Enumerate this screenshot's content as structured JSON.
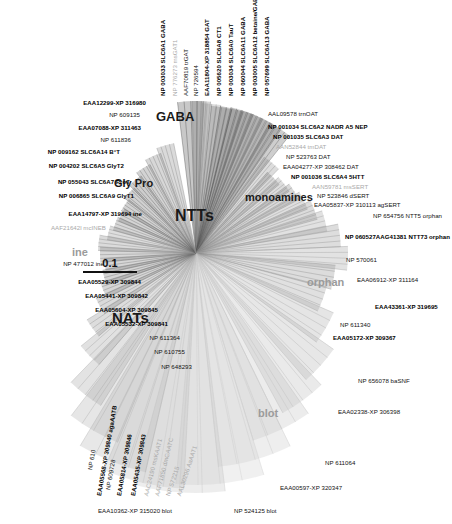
{
  "figure": {
    "type": "radial-phylogenetic-tree",
    "center": {
      "x": 196,
      "y": 253
    },
    "scale_bar": {
      "value": "0.1",
      "units": "substitutions per site",
      "length_px": 54
    }
  },
  "group_labels": [
    {
      "id": "ntts",
      "text": "NTTs",
      "x": 175,
      "y": 208,
      "size": 16,
      "style": "dark"
    },
    {
      "id": "gaba",
      "text": "GABA",
      "x": 156,
      "y": 110,
      "size": 13,
      "style": "dark"
    },
    {
      "id": "glypro",
      "text": "Gly Pro",
      "x": 114,
      "y": 178,
      "size": 11,
      "style": "dark"
    },
    {
      "id": "monoamines",
      "text": "monoamines",
      "x": 245,
      "y": 192,
      "size": 11,
      "style": "dark"
    },
    {
      "id": "ine",
      "text": "ine",
      "x": 72,
      "y": 247,
      "size": 11,
      "style": "light"
    },
    {
      "id": "nats",
      "text": "NATs",
      "x": 112,
      "y": 310,
      "size": 15,
      "style": "dark"
    },
    {
      "id": "orphan",
      "text": "orphan",
      "x": 307,
      "y": 277,
      "size": 11,
      "style": "light"
    },
    {
      "id": "blot",
      "text": "blot",
      "x": 258,
      "y": 408,
      "size": 11,
      "style": "light"
    }
  ],
  "leaves": [
    {
      "id": "l01",
      "text": "NP 003033 SLC6A1 GABA",
      "x": 163,
      "y": 96,
      "rot": -90,
      "weight": "bold",
      "anchor": "start"
    },
    {
      "id": "l02",
      "text": "NP 776273 msGAT1",
      "x": 175,
      "y": 96,
      "rot": -90,
      "weight": "gray",
      "anchor": "start"
    },
    {
      "id": "l03",
      "text": "AAF70819 trGAT",
      "x": 186,
      "y": 96,
      "rot": -90,
      "weight": "normal",
      "anchor": "start"
    },
    {
      "id": "l04",
      "text": "NP 726594",
      "x": 196,
      "y": 96,
      "rot": -90,
      "weight": "normal",
      "anchor": "start"
    },
    {
      "id": "l05",
      "text": "EAA11804-XP 318854 GAT",
      "x": 207,
      "y": 96,
      "rot": -90,
      "weight": "bold",
      "anchor": "start"
    },
    {
      "id": "l06",
      "text": "NP 005620 SLC6A8 CT1",
      "x": 219,
      "y": 96,
      "rot": -90,
      "weight": "bold",
      "anchor": "start"
    },
    {
      "id": "l07",
      "text": "NP 003034 SLC6A0 TauT",
      "x": 231,
      "y": 96,
      "rot": -90,
      "weight": "bold",
      "anchor": "start"
    },
    {
      "id": "l08",
      "text": "NP 060044 SLC6A11 GABA",
      "x": 243,
      "y": 96,
      "rot": -90,
      "weight": "bold",
      "anchor": "start"
    },
    {
      "id": "l09",
      "text": "NP 003005 SLC6A12 betaine/GABA",
      "x": 255,
      "y": 96,
      "rot": -90,
      "weight": "bold",
      "anchor": "start"
    },
    {
      "id": "l10",
      "text": "NP 057699 SLC6A13 GABA",
      "x": 267,
      "y": 96,
      "rot": -90,
      "weight": "bold",
      "anchor": "start"
    },
    {
      "id": "l11",
      "text": "AAL09578 trnOAT",
      "x": 268,
      "y": 114,
      "rot": 0,
      "weight": "normal",
      "anchor": "start"
    },
    {
      "id": "l12",
      "text": "NP 001034 SLC6A2 NADR A5 NEP",
      "x": 268,
      "y": 127,
      "rot": 0,
      "weight": "bold",
      "anchor": "start"
    },
    {
      "id": "l13",
      "text": "NP 001035 SLC6A3 DAT",
      "x": 273,
      "y": 137,
      "rot": 0,
      "weight": "bold",
      "anchor": "start"
    },
    {
      "id": "l14",
      "text": "AAN52844 tmDAT",
      "x": 276,
      "y": 147,
      "rot": 0,
      "weight": "gray",
      "anchor": "start"
    },
    {
      "id": "l15",
      "text": "NP 523763 DAT",
      "x": 286,
      "y": 157,
      "rot": 0,
      "weight": "normal",
      "anchor": "start"
    },
    {
      "id": "l16",
      "text": "EAA04277-XP 308462 DAT",
      "x": 283,
      "y": 167,
      "rot": 0,
      "weight": "normal",
      "anchor": "start"
    },
    {
      "id": "l17",
      "text": "NP 001036 SLC6A4 5HTT",
      "x": 291,
      "y": 177,
      "rot": 0,
      "weight": "bold",
      "anchor": "start"
    },
    {
      "id": "l18",
      "text": "AAN59781 msSERT",
      "x": 312,
      "y": 187,
      "rot": 0,
      "weight": "gray",
      "anchor": "start"
    },
    {
      "id": "l19",
      "text": "NP 523846 dSERT",
      "x": 317,
      "y": 196,
      "rot": 0,
      "weight": "normal",
      "anchor": "start"
    },
    {
      "id": "l20",
      "text": "EAA05837-XP 310113 agSERT",
      "x": 314,
      "y": 205,
      "rot": 0,
      "weight": "normal",
      "anchor": "start"
    },
    {
      "id": "l21",
      "text": "NP 654756 NTT5 orphan",
      "x": 373,
      "y": 216,
      "rot": 0,
      "weight": "normal",
      "anchor": "start"
    },
    {
      "id": "l22",
      "text": "NP 060527AAG41381 NTT73 orphan",
      "x": 345,
      "y": 237,
      "rot": 0,
      "weight": "bold",
      "anchor": "start"
    },
    {
      "id": "l23",
      "text": "NP 570061",
      "x": 346,
      "y": 260,
      "rot": 0,
      "weight": "normal",
      "anchor": "start"
    },
    {
      "id": "l24",
      "text": "EAA06912-XP 311164",
      "x": 357,
      "y": 280,
      "rot": 0,
      "weight": "normal",
      "anchor": "start"
    },
    {
      "id": "l25",
      "text": "EAA43361-XP 319695",
      "x": 375,
      "y": 307,
      "rot": 0,
      "weight": "bold",
      "anchor": "start"
    },
    {
      "id": "l26",
      "text": "NP 611340",
      "x": 340,
      "y": 325,
      "rot": 0,
      "weight": "normal",
      "anchor": "start"
    },
    {
      "id": "l27",
      "text": "EAA05172-XP 309367",
      "x": 333,
      "y": 338,
      "rot": 0,
      "weight": "bold",
      "anchor": "start"
    },
    {
      "id": "l28",
      "text": "NP 656078 baSNF",
      "x": 358,
      "y": 381,
      "rot": 0,
      "weight": "normal",
      "anchor": "start"
    },
    {
      "id": "l29",
      "text": "EAA02338-XP 306398",
      "x": 338,
      "y": 412,
      "rot": 0,
      "weight": "normal",
      "anchor": "start"
    },
    {
      "id": "l30",
      "text": "NP 611064",
      "x": 325,
      "y": 463,
      "rot": 0,
      "weight": "normal",
      "anchor": "start"
    },
    {
      "id": "l31",
      "text": "EAA00597-XP 320347",
      "x": 280,
      "y": 488,
      "rot": 0,
      "weight": "normal",
      "anchor": "start"
    },
    {
      "id": "l32",
      "text": "NP 524125 blot",
      "x": 234,
      "y": 511,
      "rot": 0,
      "weight": "normal",
      "anchor": "start"
    },
    {
      "id": "l33",
      "text": "EAA10362-XP 315020 blot",
      "x": 98,
      "y": 511,
      "rot": 0,
      "weight": "normal",
      "anchor": "start"
    },
    {
      "id": "l34",
      "text": "AAL30296 AaAAT1",
      "x": 179,
      "y": 496,
      "rot": -72,
      "weight": "gray",
      "anchor": "start"
    },
    {
      "id": "l35",
      "text": "NP 572215",
      "x": 168,
      "y": 496,
      "rot": -72,
      "weight": "gray",
      "anchor": "start"
    },
    {
      "id": "l36",
      "text": "AAF71850 dmCAATC",
      "x": 157,
      "y": 496,
      "rot": -76,
      "weight": "gray",
      "anchor": "start"
    },
    {
      "id": "l37",
      "text": "AAC24190 msKAAT1",
      "x": 146,
      "y": 496,
      "rot": -76,
      "weight": "gray",
      "anchor": "start"
    },
    {
      "id": "l38",
      "text": "EAA05435-XP 309843",
      "x": 133,
      "y": 496,
      "rot": -80,
      "weight": "bold",
      "anchor": "start"
    },
    {
      "id": "l39",
      "text": "EAA05814-XP 309846",
      "x": 119,
      "y": 496,
      "rot": -80,
      "weight": "bold",
      "anchor": "start"
    },
    {
      "id": "l40",
      "text": "NP 609728",
      "x": 108,
      "y": 490,
      "rot": -80,
      "weight": "normal",
      "anchor": "start"
    },
    {
      "id": "l41",
      "text": "EAA05568-XP 309840 agaAATB",
      "x": 99,
      "y": 496,
      "rot": -80,
      "weight": "bold",
      "anchor": "start"
    },
    {
      "id": "l42",
      "text": "NP 610",
      "x": 90,
      "y": 470,
      "rot": -80,
      "weight": "normal",
      "anchor": "start"
    },
    {
      "id": "l43",
      "text": "NP 648293",
      "x": 192,
      "y": 367,
      "rot": 0,
      "weight": "normal",
      "anchor": "end"
    },
    {
      "id": "l44",
      "text": "NP 610755",
      "x": 185,
      "y": 352,
      "rot": 0,
      "weight": "normal",
      "anchor": "end"
    },
    {
      "id": "l45",
      "text": "NP 611364",
      "x": 180,
      "y": 338,
      "rot": 0,
      "weight": "normal",
      "anchor": "end"
    },
    {
      "id": "l46",
      "text": "EAA05532-XP 309841",
      "x": 168,
      "y": 324,
      "rot": 0,
      "weight": "bold",
      "anchor": "end"
    },
    {
      "id": "l47",
      "text": "EAA05604-XP 309845",
      "x": 158,
      "y": 310,
      "rot": 0,
      "weight": "bold",
      "anchor": "end"
    },
    {
      "id": "l48",
      "text": "EAA05441-XP 309842",
      "x": 148,
      "y": 296,
      "rot": 0,
      "weight": "bold",
      "anchor": "end"
    },
    {
      "id": "l49",
      "text": "EAA05529-XP 309844",
      "x": 141,
      "y": 282,
      "rot": 0,
      "weight": "bold",
      "anchor": "end"
    },
    {
      "id": "l50",
      "text": "NP 477012 ine",
      "x": 104,
      "y": 264,
      "rot": 0,
      "weight": "normal",
      "anchor": "end"
    },
    {
      "id": "l51",
      "text": "AAF21642l mcINEB",
      "x": 106,
      "y": 228,
      "rot": 0,
      "weight": "gray",
      "anchor": "end"
    },
    {
      "id": "l52",
      "text": "EAA14797-XP 319694 ine",
      "x": 142,
      "y": 214,
      "rot": 0,
      "weight": "bold",
      "anchor": "end"
    },
    {
      "id": "l53",
      "text": "NP 006865 SLC6A9 GlyT1",
      "x": 134,
      "y": 196,
      "rot": 0,
      "weight": "bold",
      "anchor": "end"
    },
    {
      "id": "l54",
      "text": "NP 055043 SLC6A7 ProT",
      "x": 130,
      "y": 182,
      "rot": 0,
      "weight": "bold",
      "anchor": "end"
    },
    {
      "id": "l55",
      "text": "NP 004202 SLC6A5 GlyT2",
      "x": 124,
      "y": 166,
      "rot": 0,
      "weight": "bold",
      "anchor": "end"
    },
    {
      "id": "l56",
      "text": "NP 009162 SLC6A14 B°T",
      "x": 120,
      "y": 152,
      "rot": 0,
      "weight": "bold",
      "anchor": "end"
    },
    {
      "id": "l57",
      "text": "NP 611836",
      "x": 131,
      "y": 140,
      "rot": 0,
      "weight": "normal",
      "anchor": "end"
    },
    {
      "id": "l58",
      "text": "EAA07088-XP 311463",
      "x": 141,
      "y": 128,
      "rot": 0,
      "weight": "bold",
      "anchor": "end"
    },
    {
      "id": "l59",
      "text": "NP 609135",
      "x": 140,
      "y": 115,
      "rot": 0,
      "weight": "normal",
      "anchor": "end"
    },
    {
      "id": "l60",
      "text": "EAA12299-XP 316980",
      "x": 146,
      "y": 103,
      "rot": 0,
      "weight": "bold",
      "anchor": "end"
    }
  ],
  "branches": [
    {
      "angle": -92,
      "len": 152,
      "w": 10,
      "shade": "#4a4a4a"
    },
    {
      "angle": -88,
      "len": 152,
      "w": 7,
      "shade": "#767676"
    },
    {
      "angle": -84,
      "len": 150,
      "w": 7,
      "shade": "#8e8e8e"
    },
    {
      "angle": -80,
      "len": 148,
      "w": 8,
      "shade": "#6e6e6e"
    },
    {
      "angle": -76,
      "len": 149,
      "w": 9,
      "shade": "#575757"
    },
    {
      "angle": -72,
      "len": 150,
      "w": 9,
      "shade": "#4f4f4f"
    },
    {
      "angle": -68,
      "len": 150,
      "w": 9,
      "shade": "#606060"
    },
    {
      "angle": -64,
      "len": 150,
      "w": 9,
      "shade": "#6a6a6a"
    },
    {
      "angle": -60,
      "len": 150,
      "w": 9,
      "shade": "#747474"
    },
    {
      "angle": -56,
      "len": 150,
      "w": 9,
      "shade": "#5d5d5d"
    },
    {
      "angle": -50,
      "len": 118,
      "w": 9,
      "shade": "#8a8a8a"
    },
    {
      "angle": -44,
      "len": 108,
      "w": 9,
      "shade": "#7c7c7c"
    },
    {
      "angle": -38,
      "len": 112,
      "w": 9,
      "shade": "#8f8f8f"
    },
    {
      "angle": -32,
      "len": 116,
      "w": 9,
      "shade": "#828282"
    },
    {
      "angle": -26,
      "len": 120,
      "w": 9,
      "shade": "#959595"
    },
    {
      "angle": -20,
      "len": 126,
      "w": 9,
      "shade": "#888888"
    },
    {
      "angle": -14,
      "len": 133,
      "w": 9,
      "shade": "#9a9a9a"
    },
    {
      "angle": -7,
      "len": 145,
      "w": 9,
      "shade": "#909090"
    },
    {
      "angle": 2,
      "len": 152,
      "w": 9,
      "shade": "#a0a0a0"
    },
    {
      "angle": 10,
      "len": 140,
      "w": 10,
      "shade": "#8c8c8c"
    },
    {
      "angle": 20,
      "len": 135,
      "w": 11,
      "shade": "#999999"
    },
    {
      "angle": 30,
      "len": 150,
      "w": 13,
      "shade": "#a8a8a8"
    },
    {
      "angle": 42,
      "len": 168,
      "w": 14,
      "shade": "#b0b0b0"
    },
    {
      "angle": 54,
      "len": 182,
      "w": 15,
      "shade": "#b8b8b8"
    },
    {
      "angle": 64,
      "len": 196,
      "w": 18,
      "shade": "#c0c0c0"
    },
    {
      "angle": 74,
      "len": 215,
      "w": 20,
      "shade": "#c6c6c6"
    },
    {
      "angle": 84,
      "len": 232,
      "w": 22,
      "shade": "#cccccc"
    },
    {
      "angle": 94,
      "len": 240,
      "w": 22,
      "shade": "#c4c4c4"
    },
    {
      "angle": 103,
      "len": 236,
      "w": 20,
      "shade": "#bcbcbc"
    },
    {
      "angle": 112,
      "len": 225,
      "w": 18,
      "shade": "#b4b4b4"
    },
    {
      "angle": 120,
      "len": 205,
      "w": 15,
      "shade": "#ababab"
    },
    {
      "angle": 128,
      "len": 180,
      "w": 12,
      "shade": "#a2a2a2"
    },
    {
      "angle": 136,
      "len": 148,
      "w": 10,
      "shade": "#9a9a9a"
    },
    {
      "angle": 144,
      "len": 128,
      "w": 9,
      "shade": "#8d8d8d"
    },
    {
      "angle": 151,
      "len": 110,
      "w": 9,
      "shade": "#838383"
    },
    {
      "angle": 158,
      "len": 100,
      "w": 9,
      "shade": "#787878"
    },
    {
      "angle": 165,
      "len": 95,
      "w": 9,
      "shade": "#6f6f6f"
    },
    {
      "angle": 172,
      "len": 92,
      "w": 9,
      "shade": "#777777"
    },
    {
      "angle": 179,
      "len": 96,
      "w": 9,
      "shade": "#7f7f7f"
    },
    {
      "angle": 186,
      "len": 98,
      "w": 9,
      "shade": "#888888"
    },
    {
      "angle": 193,
      "len": 90,
      "w": 9,
      "shade": "#8f8f8f"
    },
    {
      "angle": 200,
      "len": 86,
      "w": 9,
      "shade": "#7a7a7a"
    },
    {
      "angle": 207,
      "len": 84,
      "w": 9,
      "shade": "#727272"
    },
    {
      "angle": 214,
      "len": 86,
      "w": 9,
      "shade": "#6a6a6a"
    },
    {
      "angle": 222,
      "len": 90,
      "w": 9,
      "shade": "#626262"
    },
    {
      "angle": 230,
      "len": 95,
      "w": 9,
      "shade": "#5a5a5a"
    },
    {
      "angle": 238,
      "len": 100,
      "w": 9,
      "shade": "#6d6d6d"
    },
    {
      "angle": 246,
      "len": 106,
      "w": 9,
      "shade": "#7b7b7b"
    },
    {
      "angle": 254,
      "len": 112,
      "w": 9,
      "shade": "#858585"
    }
  ]
}
